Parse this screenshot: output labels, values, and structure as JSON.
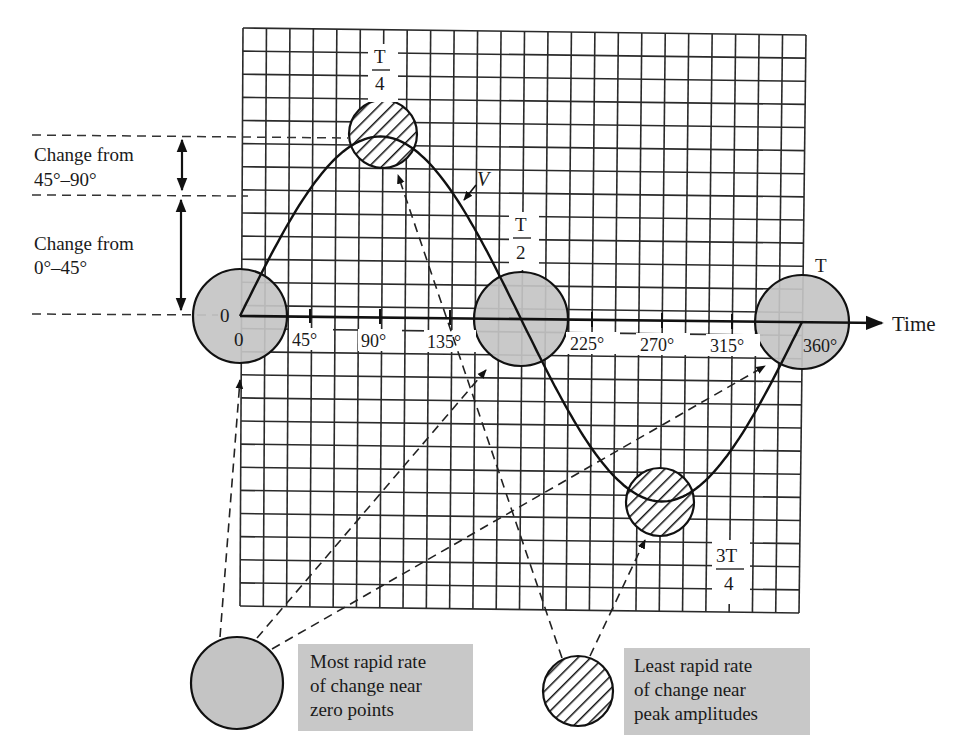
{
  "figure": {
    "type": "sine-wave-rate-of-change-diagram",
    "curve_label": "V",
    "axis_label": "Time",
    "origin_value_label": "0",
    "origin_time_label": "0",
    "colors": {
      "grid": "#2a2a2a",
      "zero_circle_fill": "#c4c4c4",
      "legend_box_fill": "#c8c8c8",
      "line": "#1a1a1a",
      "background": "#ffffff"
    }
  },
  "period_labels": {
    "quarter": {
      "num": "T",
      "den": "4"
    },
    "half": {
      "num": "T",
      "den": "2"
    },
    "three_quarter": {
      "num": "3T",
      "den": "4"
    },
    "full": "T"
  },
  "ticks": [
    "45°",
    "90°",
    "135°",
    "225°",
    "270°",
    "315°",
    "360°"
  ],
  "left_annotations": {
    "upper": {
      "line1": "Change from",
      "line2": "45°–90°"
    },
    "lower": {
      "line1": "Change from",
      "line2": "0°–45°"
    }
  },
  "legend": {
    "zero": {
      "line1": "Most rapid rate",
      "line2": "of change near",
      "line3": "zero points"
    },
    "peak": {
      "line1": "Least rapid rate",
      "line2": "of change near",
      "line3": "peak amplitudes"
    }
  },
  "chart_data": {
    "type": "line",
    "title": "",
    "xlabel": "Time",
    "ylabel": "V",
    "x": [
      0,
      45,
      90,
      135,
      180,
      225,
      270,
      315,
      360
    ],
    "x_tick_labels": [
      "0",
      "45°",
      "90°",
      "135°",
      "T/2",
      "225°",
      "270°",
      "315°",
      "360°"
    ],
    "series": [
      {
        "name": "V (sine)",
        "values": [
          0,
          0.707,
          1,
          0.707,
          0,
          -0.707,
          -1,
          -0.707,
          0
        ]
      }
    ],
    "ylim": [
      -1.2,
      1.2
    ],
    "grid": true,
    "annotations": [
      "T/4 at 90° (peak, hatched circle)",
      "T/2 at 180° (zero crossing, shaded circle)",
      "3T/4 at 270° (trough, hatched circle)",
      "T at 360° (zero crossing, shaded circle)",
      "Change from 0°–45° (≈0.707 of peak)",
      "Change from 45°–90° (≈0.293 of peak)"
    ],
    "legend": [
      "Most rapid rate of change near zero points",
      "Least rapid rate of change near peak amplitudes"
    ]
  }
}
